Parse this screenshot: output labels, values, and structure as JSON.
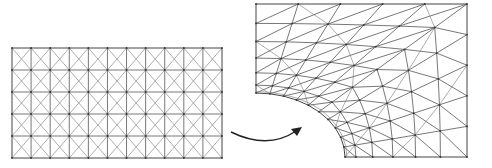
{
  "figure": {
    "width": 492,
    "height": 168,
    "stroke_color": "#555555",
    "node_color": "#333333",
    "arrow_color": "#222222"
  },
  "left_mesh": {
    "label": "original structured mesh",
    "x0": 12,
    "y0": 48,
    "x1": 222,
    "y1": 158,
    "columns": 11,
    "rows": 5,
    "cell_pattern": "quad with both diagonals (X)"
  },
  "arrow": {
    "label": "mapping arrow",
    "start": [
      231,
      132
    ],
    "control": [
      268,
      150
    ],
    "end": [
      302,
      127
    ]
  },
  "right_mesh": {
    "label": "deformed mesh around fillet",
    "outer_left_x": 256,
    "top_y": 4,
    "right_x": 467,
    "bottom_y": 157,
    "arc_start": [
      256,
      93
    ],
    "arc_end": [
      345,
      157
    ],
    "radial_layers": 6,
    "angular_segments": 10,
    "cell_pattern": "quad with single diagonals"
  }
}
